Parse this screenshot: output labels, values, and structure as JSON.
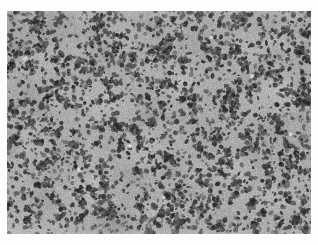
{
  "page": {
    "width": 318,
    "height": 245,
    "background_color": "#fdfdfd",
    "content_type": "grayscale-histopathology-micrograph",
    "visible_text": "",
    "caption": "",
    "scale_bar": "",
    "annotations": []
  },
  "micrograph": {
    "name": "histopathology-micrograph",
    "alt_text": "Grayscale histopathology micrograph showing a dense cellular infiltrate of small dark nuclei on a mid-gray tissue background with paler stromal bands",
    "frame": {
      "x": 7,
      "y": 11,
      "width": 304,
      "height": 223
    },
    "stain_appearance": "grayscale (H&E rendered monochrome)",
    "colors": {
      "background_tissue": "#a8a8a8",
      "pale_stroma": "#c9c9c9",
      "bright_lumen": "#eeeeee",
      "nuclei_dark": "#2c2c2c",
      "nuclei_mid": "#4e4e4e",
      "shadow_patch": "#8a8a8a",
      "border": "#fdfdfd"
    },
    "texture": {
      "nuclei_count": 5200,
      "nucleus_min_px": 1.1,
      "nucleus_max_px": 2.9,
      "mottle_blobs": 420,
      "grain_opacity": 0.22,
      "seed": 20240517
    },
    "pale_bands": [
      {
        "cx": 0.12,
        "cy": 0.22,
        "rx": 0.1,
        "ry": 0.07,
        "rot": -28,
        "level": 0.3
      },
      {
        "cx": 0.07,
        "cy": 0.55,
        "rx": 0.07,
        "ry": 0.13,
        "rot": 12,
        "level": 0.26
      },
      {
        "cx": 0.33,
        "cy": 0.42,
        "rx": 0.13,
        "ry": 0.08,
        "rot": 34,
        "level": 0.28
      },
      {
        "cx": 0.47,
        "cy": 0.6,
        "rx": 0.16,
        "ry": 0.09,
        "rot": -18,
        "level": 0.32
      },
      {
        "cx": 0.6,
        "cy": 0.3,
        "rx": 0.11,
        "ry": 0.1,
        "rot": 8,
        "level": 0.24
      },
      {
        "cx": 0.78,
        "cy": 0.18,
        "rx": 0.12,
        "ry": 0.08,
        "rot": -40,
        "level": 0.3
      },
      {
        "cx": 0.9,
        "cy": 0.38,
        "rx": 0.09,
        "ry": 0.11,
        "rot": 20,
        "level": 0.27
      },
      {
        "cx": 0.7,
        "cy": 0.72,
        "rx": 0.13,
        "ry": 0.09,
        "rot": -10,
        "level": 0.25
      },
      {
        "cx": 0.26,
        "cy": 0.8,
        "rx": 0.14,
        "ry": 0.07,
        "rot": 25,
        "level": 0.26
      },
      {
        "cx": 0.52,
        "cy": 0.9,
        "rx": 0.12,
        "ry": 0.06,
        "rot": -5,
        "level": 0.22
      },
      {
        "cx": 0.4,
        "cy": 0.12,
        "rx": 0.1,
        "ry": 0.06,
        "rot": 15,
        "level": 0.22
      },
      {
        "cx": 0.88,
        "cy": 0.82,
        "rx": 0.1,
        "ry": 0.08,
        "rot": -32,
        "level": 0.24
      }
    ],
    "dark_patches": [
      {
        "cx": 0.045,
        "cy": 0.17,
        "rx": 0.045,
        "ry": 0.065,
        "rot": -15,
        "level": 0.3
      },
      {
        "cx": 0.015,
        "cy": 0.6,
        "rx": 0.03,
        "ry": 0.08,
        "rot": 5,
        "level": 0.2
      },
      {
        "cx": 0.35,
        "cy": 0.96,
        "rx": 0.12,
        "ry": 0.05,
        "rot": 0,
        "level": 0.16
      }
    ],
    "bright_specks": [
      {
        "cx": 0.062,
        "cy": 0.212,
        "r": 2.3
      },
      {
        "cx": 0.404,
        "cy": 0.607,
        "r": 1.7
      },
      {
        "cx": 0.515,
        "cy": 0.838,
        "r": 1.6
      },
      {
        "cx": 0.806,
        "cy": 0.293,
        "r": 1.5
      },
      {
        "cx": 0.932,
        "cy": 0.552,
        "r": 1.4
      },
      {
        "cx": 0.236,
        "cy": 0.712,
        "r": 1.3
      },
      {
        "cx": 0.672,
        "cy": 0.118,
        "r": 1.4
      }
    ]
  }
}
